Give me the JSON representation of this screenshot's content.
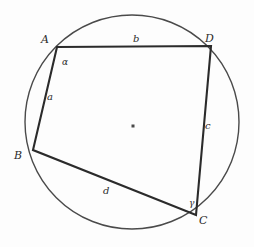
{
  "figure": {
    "background_color": "#fdfdfd",
    "stroke_color": "#2b2b2b",
    "circle": {
      "name": "circumcircle",
      "center_x": 132,
      "center_y": 122,
      "radius": 107,
      "stroke_width": 1.4
    },
    "center_point": {
      "name": "circle-center-dot",
      "x": 133,
      "y": 126,
      "size": 3
    },
    "vertices": [
      {
        "id": "A",
        "label": "A",
        "x": 57,
        "y": 47,
        "label_x": 41,
        "label_y": 34
      },
      {
        "id": "D",
        "label": "D",
        "x": 211,
        "y": 46,
        "label_x": 205,
        "label_y": 33
      },
      {
        "id": "B",
        "label": "B",
        "x": 33,
        "y": 150,
        "label_x": 14,
        "label_y": 150
      },
      {
        "id": "C",
        "label": "C",
        "x": 196,
        "y": 215,
        "label_x": 199,
        "label_y": 215
      }
    ],
    "edges": [
      {
        "id": "AD",
        "from": "A",
        "to": "D",
        "side_label": "b",
        "label_x": 133,
        "label_y": 34
      },
      {
        "id": "AB",
        "from": "A",
        "to": "B",
        "side_label": "a",
        "label_x": 47,
        "label_y": 92
      },
      {
        "id": "DC",
        "from": "D",
        "to": "C",
        "side_label": "c",
        "label_x": 205,
        "label_y": 121
      },
      {
        "id": "BC",
        "from": "B",
        "to": "C",
        "side_label": "d",
        "label_x": 103,
        "label_y": 186
      }
    ],
    "angles": [
      {
        "id": "alpha",
        "label": "α",
        "at_vertex": "A",
        "label_x": 62,
        "label_y": 58
      },
      {
        "id": "gamma",
        "label": "γ",
        "at_vertex": "C",
        "label_x": 189,
        "label_y": 199
      }
    ],
    "polygon_points": "57,47 211,46 196,215 33,150",
    "polygon_stroke_width": 2.1
  }
}
